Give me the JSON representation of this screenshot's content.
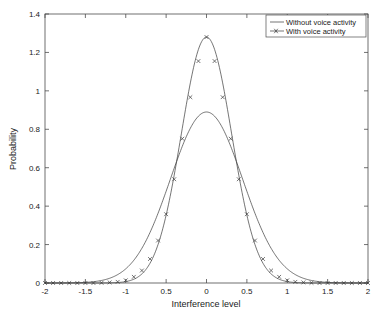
{
  "chart_data": {
    "type": "line",
    "title": "",
    "xlabel": "Interference level",
    "ylabel": "Probability",
    "xlim": [
      -2,
      2
    ],
    "ylim": [
      0,
      1.4
    ],
    "grid": false,
    "legend_position": "top-right",
    "xticks": [
      -2,
      -1.5,
      -1,
      -0.5,
      0,
      0.5,
      1,
      1.5,
      2
    ],
    "xtick_labels": [
      "-2",
      "-1.5",
      "-1",
      "0.5",
      "0",
      "0.5",
      "1",
      "1.5",
      "2"
    ],
    "yticks": [
      0,
      0.2,
      0.4,
      0.6,
      0.8,
      1,
      1.2,
      1.4
    ],
    "ytick_labels": [
      "0",
      "0.2",
      "0.4",
      "0.6",
      "0.8",
      "1",
      "1.2",
      "1.4"
    ],
    "series": [
      {
        "name": "Without voice activity",
        "marker": "none",
        "peak": 0.89,
        "mean": 0,
        "sigma": 0.448,
        "x": [
          -2,
          -1.9,
          -1.8,
          -1.7,
          -1.6,
          -1.5,
          -1.4,
          -1.3,
          -1.2,
          -1.1,
          -1,
          -0.9,
          -0.8,
          -0.7,
          -0.6,
          -0.5,
          -0.4,
          -0.3,
          -0.2,
          -0.1,
          0,
          0.1,
          0.2,
          0.3,
          0.4,
          0.5,
          0.6,
          0.7,
          0.8,
          0.9,
          1,
          1.1,
          1.2,
          1.3,
          1.4,
          1.5,
          1.6,
          1.7,
          1.8,
          1.9,
          2
        ],
        "values": [
          0.0,
          0.001,
          0.002,
          0.004,
          0.008,
          0.016,
          0.03,
          0.052,
          0.087,
          0.136,
          0.204,
          0.289,
          0.389,
          0.498,
          0.605,
          0.702,
          0.78,
          0.836,
          0.87,
          0.885,
          0.89,
          0.885,
          0.87,
          0.836,
          0.78,
          0.702,
          0.605,
          0.498,
          0.389,
          0.289,
          0.204,
          0.136,
          0.087,
          0.052,
          0.03,
          0.016,
          0.008,
          0.004,
          0.002,
          0.001,
          0.0
        ]
      },
      {
        "name": "With voice activity",
        "marker": "x",
        "peak": 1.28,
        "mean": 0,
        "sigma": 0.3115,
        "x": [
          -2,
          -1.9,
          -1.8,
          -1.7,
          -1.6,
          -1.5,
          -1.4,
          -1.3,
          -1.2,
          -1.1,
          -1,
          -0.9,
          -0.8,
          -0.7,
          -0.6,
          -0.5,
          -0.4,
          -0.3,
          -0.2,
          -0.1,
          0,
          0.1,
          0.2,
          0.3,
          0.4,
          0.5,
          0.6,
          0.7,
          0.8,
          0.9,
          1,
          1.1,
          1.2,
          1.3,
          1.4,
          1.5,
          1.6,
          1.7,
          1.8,
          1.9,
          2
        ],
        "values": [
          0.0,
          0.0,
          0.0,
          0.0,
          0.0,
          0.0,
          0.0,
          0.001,
          0.003,
          0.006,
          0.014,
          0.032,
          0.065,
          0.125,
          0.221,
          0.358,
          0.54,
          0.751,
          0.967,
          1.155,
          1.28,
          1.155,
          0.967,
          0.751,
          0.54,
          0.358,
          0.221,
          0.125,
          0.065,
          0.032,
          0.014,
          0.006,
          0.003,
          0.001,
          0.0,
          0.0,
          0.0,
          0.0,
          0.0,
          0.0,
          0.0
        ]
      }
    ]
  },
  "axes": {
    "xlabel": "Interference level",
    "ylabel": "Probability"
  },
  "legend": {
    "items": [
      {
        "label": "Without voice activity"
      },
      {
        "label": "With voice activity"
      }
    ]
  }
}
